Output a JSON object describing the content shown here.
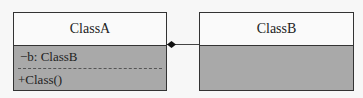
{
  "diagram": {
    "type": "uml-class",
    "classes": [
      {
        "name": "ClassA",
        "attributes": [
          "−b: ClassB"
        ],
        "methods": [
          "+Class()"
        ]
      },
      {
        "name": "ClassB",
        "attributes": [],
        "methods": []
      }
    ],
    "relationships": [
      {
        "type": "composition",
        "from": "ClassA",
        "to": "ClassB",
        "diamond_end": "ClassA"
      }
    ]
  },
  "colors": {
    "header_bg": "#fafafa",
    "body_bg": "#a9a9a9",
    "border": "#333333"
  }
}
